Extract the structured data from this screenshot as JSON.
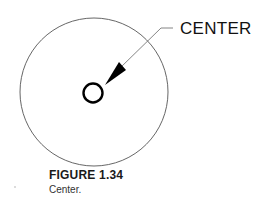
{
  "drawing": {
    "callout_label": "CENTER",
    "colors": {
      "outer_circle": "#555555",
      "center_mark": "#000000",
      "leader": "#777777",
      "arrowhead": "#000000"
    }
  },
  "caption": {
    "title": "FIGURE 1.34",
    "text": "Center."
  }
}
